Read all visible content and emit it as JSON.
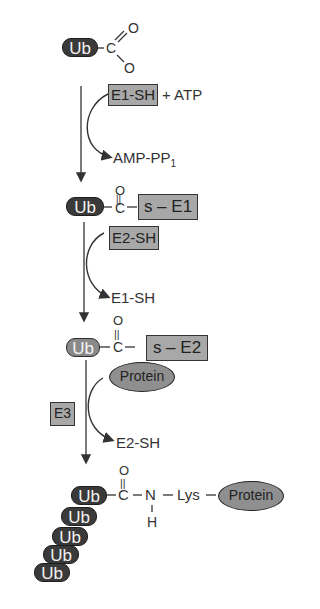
{
  "diagram": {
    "step1": {
      "ub": "Ub",
      "carbon": "C",
      "oxygen_top": "O",
      "oxygen_bottom": "O",
      "enzyme_box": "E1-SH",
      "cofactor": "+ ATP",
      "byproduct": "AMP-PP",
      "byproduct_sub": "1"
    },
    "step2": {
      "ub": "Ub",
      "oxygen": "O",
      "double_bond": "||",
      "carbon": "C",
      "enzyme_box": "s – E1",
      "incoming_box": "E2-SH",
      "released": "E1-SH"
    },
    "step3": {
      "ub": "Ub",
      "oxygen": "O",
      "double_bond": "||",
      "carbon": "C",
      "enzyme_box": "s – E2",
      "substrate_oval": "Protein",
      "ligase_box": "E3",
      "released": "E2-SH"
    },
    "step4": {
      "ub_chain": [
        "Ub",
        "Ub",
        "Ub",
        "Ub",
        "Ub"
      ],
      "oxygen": "O",
      "double_bond": "||",
      "carbon": "C",
      "nitrogen": "N",
      "hydrogen": "H",
      "lysine": "Lys",
      "substrate_oval": "Protein"
    },
    "colors": {
      "ub_dark": "#3a3a3a",
      "ub_light": "#8a8a8a",
      "enzyme_box": "#a8a8a8",
      "protein_oval": "#8f8f8f",
      "line": "#333333"
    }
  }
}
